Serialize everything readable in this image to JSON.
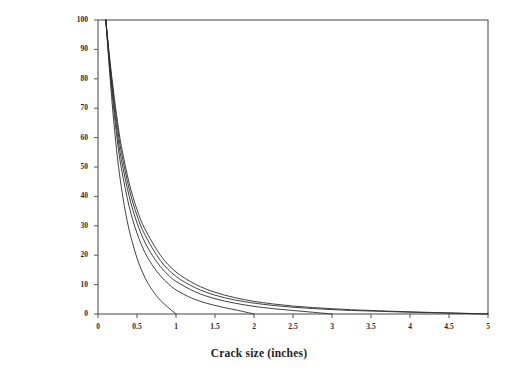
{
  "chart_data": {
    "type": "line",
    "title": "",
    "xlabel": "Crack size (inches)",
    "ylabel": "Remaining fatigue life (%)",
    "xlim": [
      0,
      5
    ],
    "ylim": [
      0,
      100
    ],
    "xticks": [
      "0",
      "0.5",
      "1",
      "1.5",
      "2",
      "2.5",
      "3",
      "3.5",
      "4",
      "4.5",
      "5"
    ],
    "xtick_values": [
      0,
      0.5,
      1,
      1.5,
      2,
      2.5,
      3,
      3.5,
      4,
      4.5,
      5
    ],
    "yticks": [
      "0",
      "10",
      "20",
      "30",
      "40",
      "50",
      "60",
      "70",
      "80",
      "90",
      "100"
    ],
    "ytick_values": [
      0,
      10,
      20,
      30,
      40,
      50,
      60,
      70,
      80,
      90,
      100
    ],
    "grid": false,
    "legend": null,
    "line_color": "#2b2b2b",
    "frame_color": "#555555",
    "background": "#ffffff",
    "series": [
      {
        "name": "curve-1",
        "x": [
          0.1,
          0.15,
          0.2,
          0.25,
          0.3,
          0.35,
          0.4,
          0.45,
          0.5,
          0.55,
          0.6,
          0.65,
          0.7,
          0.75,
          0.8,
          0.85,
          0.9,
          0.95,
          1.0
        ],
        "values": [
          100.0,
          82.0,
          66.0,
          53.0,
          43.0,
          35.0,
          28.5,
          23.5,
          19.0,
          15.5,
          12.5,
          10.0,
          8.0,
          6.2,
          4.7,
          3.4,
          2.2,
          1.1,
          0.0
        ]
      },
      {
        "name": "curve-2",
        "x": [
          0.1,
          0.15,
          0.2,
          0.25,
          0.3,
          0.4,
          0.5,
          0.6,
          0.7,
          0.8,
          0.9,
          1.0,
          1.2,
          1.4,
          1.6,
          1.8,
          1.9,
          2.0
        ],
        "values": [
          100.0,
          84.0,
          70.0,
          58.5,
          49.5,
          36.5,
          27.5,
          21.0,
          16.5,
          13.0,
          10.3,
          8.2,
          5.4,
          3.6,
          2.3,
          1.2,
          0.6,
          0.0
        ]
      },
      {
        "name": "curve-3",
        "x": [
          0.1,
          0.15,
          0.2,
          0.25,
          0.3,
          0.4,
          0.5,
          0.6,
          0.7,
          0.8,
          0.9,
          1.0,
          1.25,
          1.5,
          1.75,
          2.0,
          2.25,
          2.5,
          2.75,
          3.0
        ],
        "values": [
          100.0,
          85.0,
          72.0,
          61.0,
          52.5,
          40.0,
          31.0,
          24.5,
          19.8,
          16.1,
          13.3,
          11.1,
          7.5,
          5.2,
          3.7,
          2.6,
          1.8,
          1.2,
          0.6,
          0.0
        ]
      },
      {
        "name": "curve-4",
        "x": [
          0.1,
          0.15,
          0.2,
          0.25,
          0.3,
          0.4,
          0.5,
          0.6,
          0.8,
          1.0,
          1.25,
          1.5,
          1.75,
          2.0,
          2.25,
          2.5,
          2.75,
          3.0,
          3.25,
          3.5,
          3.75,
          4.0,
          4.25,
          4.5,
          4.75,
          5.0
        ],
        "values": [
          100.0,
          86.0,
          74.0,
          63.5,
          55.0,
          42.5,
          33.5,
          27.0,
          18.2,
          12.8,
          8.9,
          6.4,
          4.8,
          3.7,
          2.9,
          2.3,
          1.85,
          1.5,
          1.2,
          1.0,
          0.8,
          0.6,
          0.45,
          0.3,
          0.15,
          0.0
        ]
      },
      {
        "name": "curve-5",
        "x": [
          0.1,
          0.15,
          0.2,
          0.25,
          0.3,
          0.4,
          0.5,
          0.6,
          0.8,
          1.0,
          1.25,
          1.5,
          1.75,
          2.0,
          2.25,
          2.5,
          2.75,
          3.0,
          3.25,
          3.5,
          3.75,
          4.0,
          4.25,
          4.5,
          4.75,
          5.0
        ],
        "values": [
          100.0,
          87.0,
          75.5,
          65.5,
          57.0,
          44.5,
          35.5,
          29.0,
          20.0,
          14.3,
          10.1,
          7.4,
          5.6,
          4.3,
          3.4,
          2.7,
          2.2,
          1.8,
          1.45,
          1.2,
          0.95,
          0.75,
          0.55,
          0.38,
          0.2,
          0.0
        ]
      }
    ]
  },
  "axes": {
    "x_title": "Crack size (inches)",
    "y_title": "Remaining fatigue life (%)"
  }
}
